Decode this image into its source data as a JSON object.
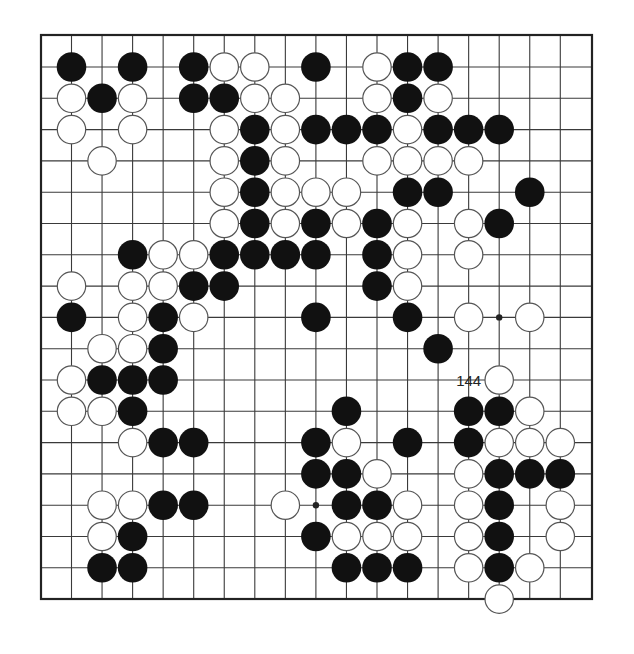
{
  "diagram": {
    "type": "go-board-partial",
    "columns": 17,
    "rows": 17,
    "grid": {
      "origin_x": 71.5,
      "origin_y": 67,
      "dx": 30.55,
      "dy": 31.3
    },
    "border": {
      "left": 41,
      "top": 35,
      "right": 592,
      "bottom": 599
    },
    "colors": {
      "line": "#3a3a3a",
      "border": "#222222",
      "black_stone": "#111111",
      "white_stone": "#ffffff",
      "white_stone_edge": "#555555",
      "background": "#ffffff"
    },
    "star_points": [
      [
        14,
        8
      ],
      [
        8,
        14
      ]
    ],
    "stones": {
      "black": [
        [
          0,
          0
        ],
        [
          2,
          0
        ],
        [
          4,
          0
        ],
        [
          8,
          0
        ],
        [
          11,
          0
        ],
        [
          12,
          0
        ],
        [
          1,
          1
        ],
        [
          4,
          1
        ],
        [
          5,
          1
        ],
        [
          11,
          1
        ],
        [
          6,
          2
        ],
        [
          8,
          2
        ],
        [
          9,
          2
        ],
        [
          10,
          2
        ],
        [
          12,
          2
        ],
        [
          13,
          2
        ],
        [
          14,
          2
        ],
        [
          6,
          3
        ],
        [
          6,
          4
        ],
        [
          11,
          4
        ],
        [
          12,
          4
        ],
        [
          15,
          4
        ],
        [
          6,
          5
        ],
        [
          8,
          5
        ],
        [
          10,
          5
        ],
        [
          14,
          5
        ],
        [
          2,
          6
        ],
        [
          5,
          6
        ],
        [
          6,
          6
        ],
        [
          7,
          6
        ],
        [
          8,
          6
        ],
        [
          10,
          6
        ],
        [
          4,
          7
        ],
        [
          5,
          7
        ],
        [
          10,
          7
        ],
        [
          0,
          8
        ],
        [
          3,
          8
        ],
        [
          8,
          8
        ],
        [
          11,
          8
        ],
        [
          3,
          9
        ],
        [
          12,
          9
        ],
        [
          1,
          10
        ],
        [
          2,
          10
        ],
        [
          3,
          10
        ],
        [
          2,
          11
        ],
        [
          9,
          11
        ],
        [
          13,
          11
        ],
        [
          14,
          11
        ],
        [
          3,
          12
        ],
        [
          4,
          12
        ],
        [
          8,
          12
        ],
        [
          11,
          12
        ],
        [
          13,
          12
        ],
        [
          8,
          13
        ],
        [
          9,
          13
        ],
        [
          14,
          13
        ],
        [
          15,
          13
        ],
        [
          16,
          13
        ],
        [
          3,
          14
        ],
        [
          4,
          14
        ],
        [
          9,
          14
        ],
        [
          10,
          14
        ],
        [
          14,
          14
        ],
        [
          2,
          15
        ],
        [
          8,
          15
        ],
        [
          14,
          15
        ],
        [
          1,
          16
        ],
        [
          2,
          16
        ],
        [
          9,
          16
        ],
        [
          10,
          16
        ],
        [
          11,
          16
        ],
        [
          14,
          16
        ]
      ],
      "white": [
        [
          5,
          0
        ],
        [
          6,
          0
        ],
        [
          10,
          0
        ],
        [
          0,
          1
        ],
        [
          2,
          1
        ],
        [
          6,
          1
        ],
        [
          7,
          1
        ],
        [
          10,
          1
        ],
        [
          12,
          1
        ],
        [
          0,
          2
        ],
        [
          2,
          2
        ],
        [
          5,
          2
        ],
        [
          7,
          2
        ],
        [
          11,
          2
        ],
        [
          1,
          3
        ],
        [
          5,
          3
        ],
        [
          7,
          3
        ],
        [
          10,
          3
        ],
        [
          11,
          3
        ],
        [
          12,
          3
        ],
        [
          13,
          3
        ],
        [
          5,
          4
        ],
        [
          7,
          4
        ],
        [
          8,
          4
        ],
        [
          9,
          4
        ],
        [
          5,
          5
        ],
        [
          7,
          5
        ],
        [
          9,
          5
        ],
        [
          11,
          5
        ],
        [
          13,
          5
        ],
        [
          3,
          6
        ],
        [
          4,
          6
        ],
        [
          11,
          6
        ],
        [
          13,
          6
        ],
        [
          0,
          7
        ],
        [
          2,
          7
        ],
        [
          3,
          7
        ],
        [
          11,
          7
        ],
        [
          2,
          8
        ],
        [
          4,
          8
        ],
        [
          13,
          8
        ],
        [
          15,
          8
        ],
        [
          1,
          9
        ],
        [
          2,
          9
        ],
        [
          0,
          10
        ],
        [
          14,
          10
        ],
        [
          0,
          11
        ],
        [
          1,
          11
        ],
        [
          15,
          11
        ],
        [
          2,
          12
        ],
        [
          9,
          12
        ],
        [
          14,
          12
        ],
        [
          15,
          12
        ],
        [
          16,
          12
        ],
        [
          10,
          13
        ],
        [
          13,
          13
        ],
        [
          1,
          14
        ],
        [
          2,
          14
        ],
        [
          7,
          14
        ],
        [
          11,
          14
        ],
        [
          13,
          14
        ],
        [
          16,
          14
        ],
        [
          1,
          15
        ],
        [
          9,
          15
        ],
        [
          10,
          15
        ],
        [
          11,
          15
        ],
        [
          13,
          15
        ],
        [
          16,
          15
        ],
        [
          13,
          16
        ],
        [
          15,
          16
        ],
        [
          14,
          17
        ]
      ]
    },
    "labeled_stones": [
      {
        "col": 13,
        "row": 10,
        "color": "white",
        "label": "144"
      }
    ]
  }
}
